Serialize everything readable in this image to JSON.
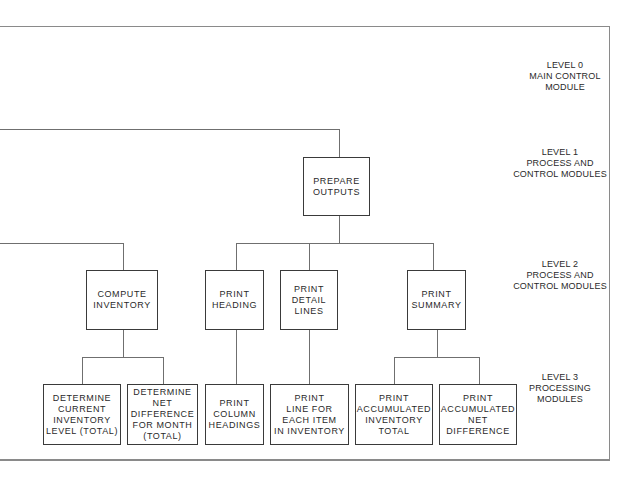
{
  "diagram": {
    "type": "hierarchy chart",
    "levels": [
      {
        "id": "level0",
        "label": "LEVEL 0\nMAIN CONTROL\nMODULE"
      },
      {
        "id": "level1",
        "label": "LEVEL 1\nPROCESS AND\nCONTROL MODULES"
      },
      {
        "id": "level2",
        "label": "LEVEL 2\nPROCESS AND\nCONTROL MODULES"
      },
      {
        "id": "level3",
        "label": "LEVEL 3\nPROCESSING\nMODULES"
      }
    ],
    "modules": {
      "prepare_outputs": "PREPARE\nOUTPUTS",
      "compute_inventory": "COMPUTE\nINVENTORY",
      "print_heading": "PRINT\nHEADING",
      "print_detail_lines": "PRINT\nDETAIL\nLINES",
      "print_summary": "PRINT\nSUMMARY",
      "determine_current_inventory": "DETERMINE\nCURRENT\nINVENTORY\nLEVEL (TOTAL)",
      "determine_net_difference": "DETERMINE\nNET\nDIFFERENCE\nFOR MONTH\n(TOTAL)",
      "print_column_headings": "PRINT\nCOLUMN\nHEADINGS",
      "print_line_each_item": "PRINT\nLINE FOR\nEACH ITEM\nIN INVENTORY",
      "print_accumulated_inventory_total": "PRINT\nACCUMULATED\nINVENTORY\nTOTAL",
      "print_accumulated_net_difference": "PRINT\nACCUMULATED\nNET\nDIFFERENCE"
    },
    "edges": [
      [
        "main_control",
        "prepare_outputs"
      ],
      [
        "process_control",
        "compute_inventory"
      ],
      [
        "prepare_outputs",
        "print_heading"
      ],
      [
        "prepare_outputs",
        "print_detail_lines"
      ],
      [
        "prepare_outputs",
        "print_summary"
      ],
      [
        "compute_inventory",
        "determine_current_inventory"
      ],
      [
        "compute_inventory",
        "determine_net_difference"
      ],
      [
        "print_heading",
        "print_column_headings"
      ],
      [
        "print_detail_lines",
        "print_line_each_item"
      ],
      [
        "print_summary",
        "print_accumulated_inventory_total"
      ],
      [
        "print_summary",
        "print_accumulated_net_difference"
      ]
    ]
  }
}
